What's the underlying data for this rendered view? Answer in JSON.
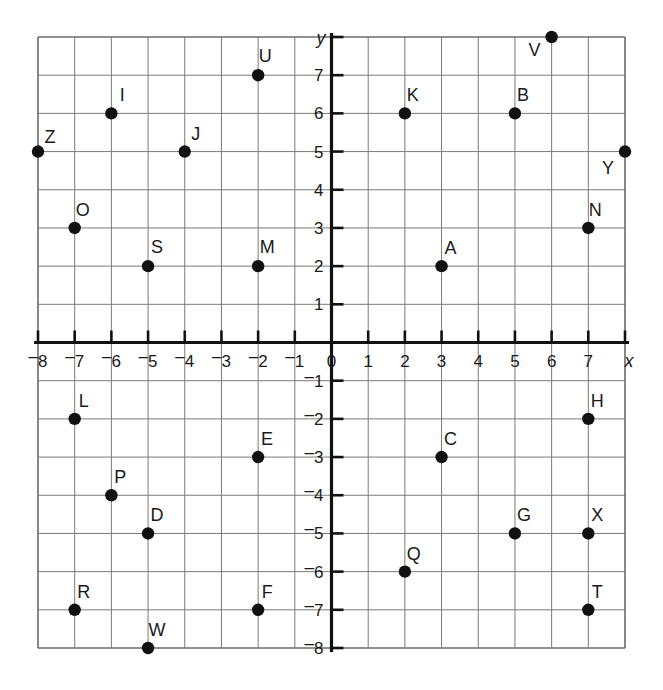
{
  "chart_data": {
    "type": "scatter",
    "title": "",
    "xlabel": "x",
    "ylabel": "y",
    "grid": true,
    "legend": "none",
    "xlim": [
      -8,
      8
    ],
    "ylim": [
      -8,
      8
    ],
    "x_tick_labels": [
      "-8",
      "-7",
      "-6",
      "-5",
      "-4",
      "-3",
      "-2",
      "-1",
      "0",
      "1",
      "2",
      "3",
      "4",
      "5",
      "6",
      "7"
    ],
    "y_tick_labels": [
      "7",
      "6",
      "5",
      "4",
      "3",
      "2",
      "1",
      "-1",
      "-2",
      "-3",
      "-4",
      "-5",
      "-6",
      "-7",
      "-8"
    ],
    "negative_sign_style": "raised-minus",
    "origin_label": "0",
    "points": [
      {
        "label": "Z",
        "x": -8,
        "y": 5,
        "lx": 12,
        "ly": -9
      },
      {
        "label": "I",
        "x": -6,
        "y": 6,
        "lx": 11,
        "ly": -12
      },
      {
        "label": "J",
        "x": -4,
        "y": 5,
        "lx": 11,
        "ly": -12
      },
      {
        "label": "U",
        "x": -2,
        "y": 7,
        "lx": 7,
        "ly": -13
      },
      {
        "label": "O",
        "x": -7,
        "y": 3,
        "lx": 8,
        "ly": -12
      },
      {
        "label": "S",
        "x": -5,
        "y": 2,
        "lx": 9,
        "ly": -13
      },
      {
        "label": "M",
        "x": -2,
        "y": 2,
        "lx": 9,
        "ly": -13
      },
      {
        "label": "K",
        "x": 2,
        "y": 6,
        "lx": 8,
        "ly": -12
      },
      {
        "label": "B",
        "x": 5,
        "y": 6,
        "lx": 8,
        "ly": -12
      },
      {
        "label": "V",
        "x": 6,
        "y": 8,
        "lx": -17,
        "ly": 19
      },
      {
        "label": "Y",
        "x": 8,
        "y": 5,
        "lx": -17,
        "ly": 22
      },
      {
        "label": "N",
        "x": 7,
        "y": 3,
        "lx": 7,
        "ly": -12
      },
      {
        "label": "A",
        "x": 3,
        "y": 2,
        "lx": 9,
        "ly": -12
      },
      {
        "label": "L",
        "x": -7,
        "y": -2,
        "lx": 9,
        "ly": -12
      },
      {
        "label": "E",
        "x": -2,
        "y": -3,
        "lx": 9,
        "ly": -12
      },
      {
        "label": "P",
        "x": -6,
        "y": -4,
        "lx": 9,
        "ly": -12
      },
      {
        "label": "D",
        "x": -5,
        "y": -5,
        "lx": 9,
        "ly": -12
      },
      {
        "label": "R",
        "x": -7,
        "y": -7,
        "lx": 9,
        "ly": -12
      },
      {
        "label": "F",
        "x": -2,
        "y": -7,
        "lx": 9,
        "ly": -12
      },
      {
        "label": "W",
        "x": -5,
        "y": -8,
        "lx": 9,
        "ly": -12
      },
      {
        "label": "H",
        "x": 7,
        "y": -2,
        "lx": 9,
        "ly": -12
      },
      {
        "label": "C",
        "x": 3,
        "y": -3,
        "lx": 9,
        "ly": -12
      },
      {
        "label": "G",
        "x": 5,
        "y": -5,
        "lx": 9,
        "ly": -12
      },
      {
        "label": "X",
        "x": 7,
        "y": -5,
        "lx": 9,
        "ly": -12
      },
      {
        "label": "Q",
        "x": 2,
        "y": -6,
        "lx": 9,
        "ly": -12
      },
      {
        "label": "T",
        "x": 7,
        "y": -7,
        "lx": 9,
        "ly": -12
      }
    ]
  }
}
